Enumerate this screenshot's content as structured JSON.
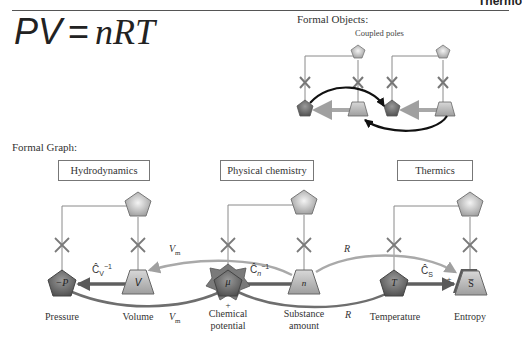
{
  "header": {
    "running_title": "Thermo"
  },
  "equation": {
    "lhs": "PV",
    "equals": "=",
    "rhs": "nRT"
  },
  "formal_objects": {
    "title": "Formal Objects:",
    "subtitle": "Coupled poles"
  },
  "formal_graph": {
    "title": "Formal Graph:",
    "domains": [
      {
        "label": "Hydrodynamics"
      },
      {
        "label": "Physical chemistry"
      },
      {
        "label": "Thermics"
      }
    ],
    "nodes": [
      {
        "symbol": "−P",
        "label": "Pressure"
      },
      {
        "symbol": "V",
        "label": "Volume"
      },
      {
        "symbol": "μ",
        "label_line1": "Chemical",
        "label_line2": "potential",
        "sign": "+"
      },
      {
        "symbol": "n",
        "label_line1": "Substance",
        "label_line2": "amount"
      },
      {
        "symbol": "T",
        "label": "Temperature"
      },
      {
        "symbol": "S̅",
        "label": "Entropy",
        "sign": "+"
      }
    ],
    "edges": {
      "capacitance_v": {
        "base": "Ĉ",
        "sub": "V",
        "sup": "−1"
      },
      "capacitance_n": {
        "base": "Ĉ",
        "sub": "n",
        "sup": "−1"
      },
      "capacitance_s": {
        "base": "Ĉ",
        "sub": "S"
      },
      "vm_top": "V",
      "vm_top_sub": "m",
      "vm_bottom": "V",
      "vm_bottom_sub": "m",
      "r_top": "R",
      "r_bottom": "R"
    }
  },
  "colors": {
    "pentagon_fill": "#c8c8c8",
    "dark_pentagon_fill": "#6e6e6e",
    "trapezoid_fill": "#bdbdbd",
    "arrow_gray": "#8a8a8a",
    "arrow_dark": "#5a5a5a",
    "curve_light": "#a9a9a9",
    "curve_black": "#111111",
    "line": "#808080"
  }
}
